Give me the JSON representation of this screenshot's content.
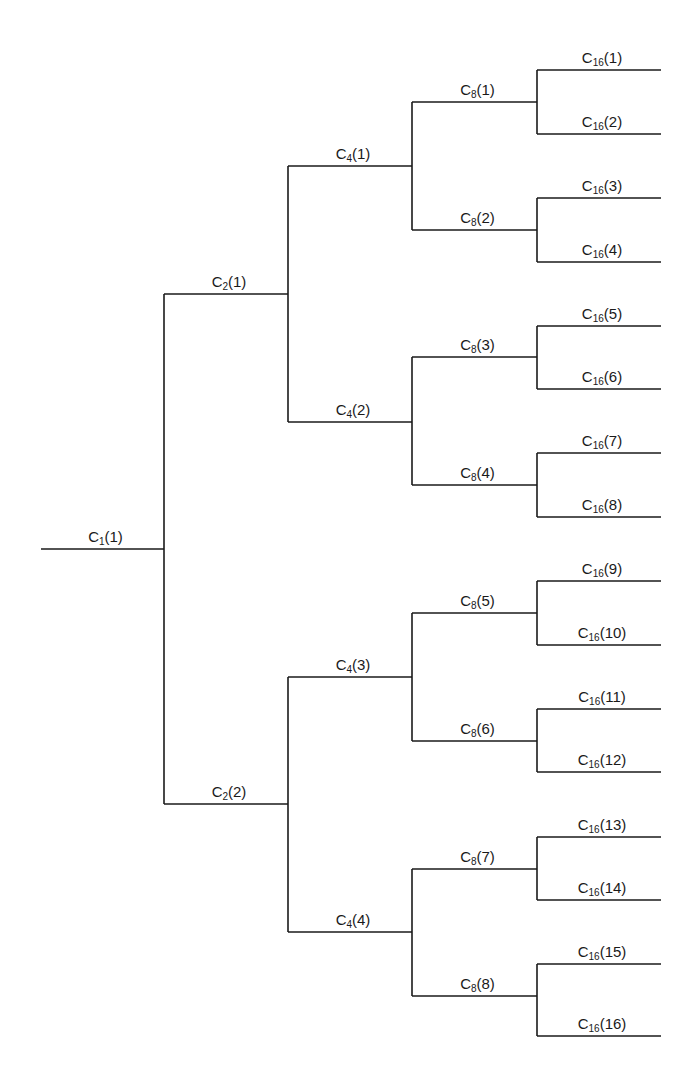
{
  "diagram": {
    "type": "binary-tree",
    "orientation": "left-to-right",
    "line_color": "#1a1a1a",
    "levels": [
      1,
      2,
      4,
      8,
      16
    ],
    "nodes": [
      {
        "id": "C1_1",
        "base": "C",
        "sub": "1",
        "index": "1",
        "level": 0,
        "x1": 41,
        "x2": 164,
        "y": 549
      },
      {
        "id": "C2_1",
        "base": "C",
        "sub": "2",
        "index": "1",
        "level": 1,
        "x1": 164,
        "x2": 288,
        "y": 294,
        "parent": "C1_1"
      },
      {
        "id": "C2_2",
        "base": "C",
        "sub": "2",
        "index": "2",
        "level": 1,
        "x1": 164,
        "x2": 288,
        "y": 804,
        "parent": "C1_1"
      },
      {
        "id": "C4_1",
        "base": "C",
        "sub": "4",
        "index": "1",
        "level": 2,
        "x1": 288,
        "x2": 412,
        "y": 166,
        "parent": "C2_1"
      },
      {
        "id": "C4_2",
        "base": "C",
        "sub": "4",
        "index": "2",
        "level": 2,
        "x1": 288,
        "x2": 412,
        "y": 422,
        "parent": "C2_1"
      },
      {
        "id": "C4_3",
        "base": "C",
        "sub": "4",
        "index": "3",
        "level": 2,
        "x1": 288,
        "x2": 412,
        "y": 677,
        "parent": "C2_2"
      },
      {
        "id": "C4_4",
        "base": "C",
        "sub": "4",
        "index": "4",
        "level": 2,
        "x1": 288,
        "x2": 412,
        "y": 932,
        "parent": "C2_2"
      },
      {
        "id": "C8_1",
        "base": "C",
        "sub": "8",
        "index": "1",
        "level": 3,
        "x1": 412,
        "x2": 537,
        "y": 102,
        "parent": "C4_1"
      },
      {
        "id": "C8_2",
        "base": "C",
        "sub": "8",
        "index": "2",
        "level": 3,
        "x1": 412,
        "x2": 537,
        "y": 230,
        "parent": "C4_1"
      },
      {
        "id": "C8_3",
        "base": "C",
        "sub": "8",
        "index": "3",
        "level": 3,
        "x1": 412,
        "x2": 537,
        "y": 357,
        "parent": "C4_2"
      },
      {
        "id": "C8_4",
        "base": "C",
        "sub": "8",
        "index": "4",
        "level": 3,
        "x1": 412,
        "x2": 537,
        "y": 485,
        "parent": "C4_2"
      },
      {
        "id": "C8_5",
        "base": "C",
        "sub": "8",
        "index": "5",
        "level": 3,
        "x1": 412,
        "x2": 537,
        "y": 613,
        "parent": "C4_3"
      },
      {
        "id": "C8_6",
        "base": "C",
        "sub": "8",
        "index": "6",
        "level": 3,
        "x1": 412,
        "x2": 537,
        "y": 741,
        "parent": "C4_3"
      },
      {
        "id": "C8_7",
        "base": "C",
        "sub": "8",
        "index": "7",
        "level": 3,
        "x1": 412,
        "x2": 537,
        "y": 869,
        "parent": "C4_4"
      },
      {
        "id": "C8_8",
        "base": "C",
        "sub": "8",
        "index": "8",
        "level": 3,
        "x1": 412,
        "x2": 537,
        "y": 996,
        "parent": "C4_4"
      },
      {
        "id": "C16_1",
        "base": "C",
        "sub": "16",
        "index": "1",
        "level": 4,
        "x1": 537,
        "x2": 661,
        "y": 70,
        "parent": "C8_1"
      },
      {
        "id": "C16_2",
        "base": "C",
        "sub": "16",
        "index": "2",
        "level": 4,
        "x1": 537,
        "x2": 661,
        "y": 134,
        "parent": "C8_1"
      },
      {
        "id": "C16_3",
        "base": "C",
        "sub": "16",
        "index": "3",
        "level": 4,
        "x1": 537,
        "x2": 661,
        "y": 198,
        "parent": "C8_2"
      },
      {
        "id": "C16_4",
        "base": "C",
        "sub": "16",
        "index": "4",
        "level": 4,
        "x1": 537,
        "x2": 661,
        "y": 262,
        "parent": "C8_2"
      },
      {
        "id": "C16_5",
        "base": "C",
        "sub": "16",
        "index": "5",
        "level": 4,
        "x1": 537,
        "x2": 661,
        "y": 326,
        "parent": "C8_3"
      },
      {
        "id": "C16_6",
        "base": "C",
        "sub": "16",
        "index": "6",
        "level": 4,
        "x1": 537,
        "x2": 661,
        "y": 389,
        "parent": "C8_3"
      },
      {
        "id": "C16_7",
        "base": "C",
        "sub": "16",
        "index": "7",
        "level": 4,
        "x1": 537,
        "x2": 661,
        "y": 453,
        "parent": "C8_4"
      },
      {
        "id": "C16_8",
        "base": "C",
        "sub": "16",
        "index": "8",
        "level": 4,
        "x1": 537,
        "x2": 661,
        "y": 517,
        "parent": "C8_4"
      },
      {
        "id": "C16_9",
        "base": "C",
        "sub": "16",
        "index": "9",
        "level": 4,
        "x1": 537,
        "x2": 661,
        "y": 581,
        "parent": "C8_5"
      },
      {
        "id": "C16_10",
        "base": "C",
        "sub": "16",
        "index": "10",
        "level": 4,
        "x1": 537,
        "x2": 661,
        "y": 645,
        "parent": "C8_5"
      },
      {
        "id": "C16_11",
        "base": "C",
        "sub": "16",
        "index": "11",
        "level": 4,
        "x1": 537,
        "x2": 661,
        "y": 709,
        "parent": "C8_6"
      },
      {
        "id": "C16_12",
        "base": "C",
        "sub": "16",
        "index": "12",
        "level": 4,
        "x1": 537,
        "x2": 661,
        "y": 772,
        "parent": "C8_6"
      },
      {
        "id": "C16_13",
        "base": "C",
        "sub": "16",
        "index": "13",
        "level": 4,
        "x1": 537,
        "x2": 661,
        "y": 837,
        "parent": "C8_7"
      },
      {
        "id": "C16_14",
        "base": "C",
        "sub": "16",
        "index": "14",
        "level": 4,
        "x1": 537,
        "x2": 661,
        "y": 900,
        "parent": "C8_7"
      },
      {
        "id": "C16_15",
        "base": "C",
        "sub": "16",
        "index": "15",
        "level": 4,
        "x1": 537,
        "x2": 661,
        "y": 964,
        "parent": "C8_8"
      },
      {
        "id": "C16_16",
        "base": "C",
        "sub": "16",
        "index": "16",
        "level": 4,
        "x1": 537,
        "x2": 661,
        "y": 1036,
        "parent": "C8_8"
      }
    ]
  }
}
